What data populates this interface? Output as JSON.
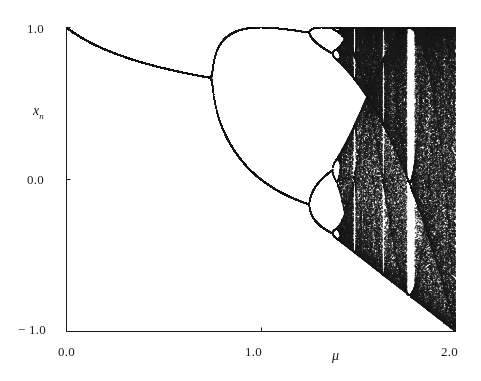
{
  "figure": {
    "kind": "bifurcation-diagram",
    "background_color": "#ffffff",
    "ink_color": "#1b1b1b"
  },
  "axes": {
    "x_title": "μ",
    "y_title_base": "x",
    "y_title_sub": "n",
    "x_ticks": [
      "0.0",
      "1.0",
      "2.0"
    ],
    "y_ticks": [
      "1.0",
      "0.0",
      "− 1.0"
    ]
  },
  "chart_data": {
    "type": "scatter",
    "title": "",
    "subtitle": "",
    "xlabel": "μ",
    "ylabel": "x_n",
    "xlim": [
      0.0,
      2.0
    ],
    "ylim": [
      -1.0,
      1.0
    ],
    "xticks": [
      0.0,
      1.0,
      2.0
    ],
    "xticklabels": [
      "0.0",
      "1.0",
      "2.0"
    ],
    "yticks": [
      1.0,
      0.0,
      -1.0
    ],
    "yticklabels": [
      "1.0",
      "0.0",
      "− 1.0"
    ],
    "grid": false,
    "legend": false,
    "legend_position": "none",
    "map_equation": "x_{n+1} = 1 - mu * x_n^2",
    "mu_min": 0.0,
    "mu_max": 2.0,
    "mu_steps": 1180,
    "transient_iterations": 300,
    "plotted_iterations": 260,
    "x_initial": 0.35,
    "point_color": "#1b1b1b",
    "point_size_px": 1,
    "annotations": [
      {
        "label": "period-1 fixed point branch",
        "mu_range": [
          0.0,
          0.75
        ],
        "x_range": [
          1.0,
          0.62
        ]
      },
      {
        "label": "first period-doubling (period 1 to 2)",
        "mu": 0.75,
        "x": 0.62
      },
      {
        "label": "second period-doubling (period 2 to 4)",
        "mu": 1.25,
        "x_upper": 0.97,
        "x_lower": -0.22
      },
      {
        "label": "onset of chaos (accumulation point)",
        "mu": 1.401
      },
      {
        "label": "period-3 window",
        "mu_range": [
          1.75,
          1.79
        ]
      },
      {
        "label": "periodic window",
        "mu_range": [
          1.63,
          1.65
        ]
      },
      {
        "label": "periodic window",
        "mu_range": [
          1.86,
          1.89
        ]
      },
      {
        "label": "lower attractor envelope reaches -1 at mu = 2",
        "mu": 2.0,
        "x": -1.0
      }
    ],
    "series": [
      {
        "name": "attractor",
        "description": "Set of asymptotic x_n values of the quadratic map x_{n+1} = 1 - mu x_n^2 for each mu",
        "sample_points": [
          {
            "mu": 0.0,
            "x": [
              1.0
            ]
          },
          {
            "mu": 0.1,
            "x": [
              0.917
            ]
          },
          {
            "mu": 0.2,
            "x": [
              0.854
            ]
          },
          {
            "mu": 0.3,
            "x": [
              0.804
            ]
          },
          {
            "mu": 0.4,
            "x": [
              0.765
            ]
          },
          {
            "mu": 0.5,
            "x": [
              0.732
            ]
          },
          {
            "mu": 0.6,
            "x": [
              0.703
            ]
          },
          {
            "mu": 0.7,
            "x": [
              0.679
            ]
          },
          {
            "mu": 0.75,
            "x": [
              0.667
            ]
          },
          {
            "mu": 0.8,
            "x": [
              0.891,
              0.365
            ]
          },
          {
            "mu": 0.9,
            "x": [
              0.952,
              0.185
            ]
          },
          {
            "mu": 1.0,
            "x": [
              1.0,
              0.0
            ]
          },
          {
            "mu": 1.1,
            "x": [
              0.99,
              -0.078
            ]
          },
          {
            "mu": 1.2,
            "x": [
              0.979,
              -0.15
            ]
          },
          {
            "mu": 1.25,
            "x": [
              0.972,
              -0.181
            ]
          },
          {
            "mu": 1.3,
            "x": [
              0.993,
              0.937,
              -0.142,
              -0.276
            ]
          },
          {
            "mu": 1.35,
            "x": [
              0.998,
              0.905,
              -0.106,
              -0.344
            ]
          },
          {
            "mu": 1.4,
            "x": [
              0.999,
              0.884,
              -0.08,
              -0.389
            ]
          },
          {
            "mu": 1.45,
            "x": [
              1.0,
              0.86,
              -0.06,
              -0.44
            ]
          },
          {
            "mu": 1.5,
            "x": [
              1.0,
              -0.5
            ]
          },
          {
            "mu": 1.6,
            "x": [
              1.0,
              -0.6
            ]
          },
          {
            "mu": 1.7,
            "x": [
              1.0,
              -0.7
            ]
          },
          {
            "mu": 1.76,
            "x": [
              1.0,
              0.87,
              -0.333
            ]
          },
          {
            "mu": 1.8,
            "x": [
              1.0,
              -0.8
            ]
          },
          {
            "mu": 1.9,
            "x": [
              1.0,
              -0.9
            ]
          },
          {
            "mu": 2.0,
            "x": [
              1.0,
              -1.0
            ]
          }
        ]
      },
      {
        "name": "upper-envelope",
        "description": "Maximum of the attractor, equals 1 once chaotic",
        "values": [
          {
            "mu": 0.0,
            "x": 1.0
          },
          {
            "mu": 0.25,
            "x": 0.828
          },
          {
            "mu": 0.5,
            "x": 0.732
          },
          {
            "mu": 0.75,
            "x": 0.667
          },
          {
            "mu": 1.0,
            "x": 1.0
          },
          {
            "mu": 1.25,
            "x": 0.972
          },
          {
            "mu": 1.5,
            "x": 1.0
          },
          {
            "mu": 2.0,
            "x": 1.0
          }
        ]
      },
      {
        "name": "lower-envelope",
        "description": "Minimum of the attractor, the line 1 - mu in the chaotic band",
        "values": [
          {
            "mu": 1.0,
            "x": 0.0
          },
          {
            "mu": 1.25,
            "x": -0.25
          },
          {
            "mu": 1.5,
            "x": -0.5
          },
          {
            "mu": 1.75,
            "x": -0.75
          },
          {
            "mu": 2.0,
            "x": -1.0
          }
        ]
      }
    ]
  }
}
